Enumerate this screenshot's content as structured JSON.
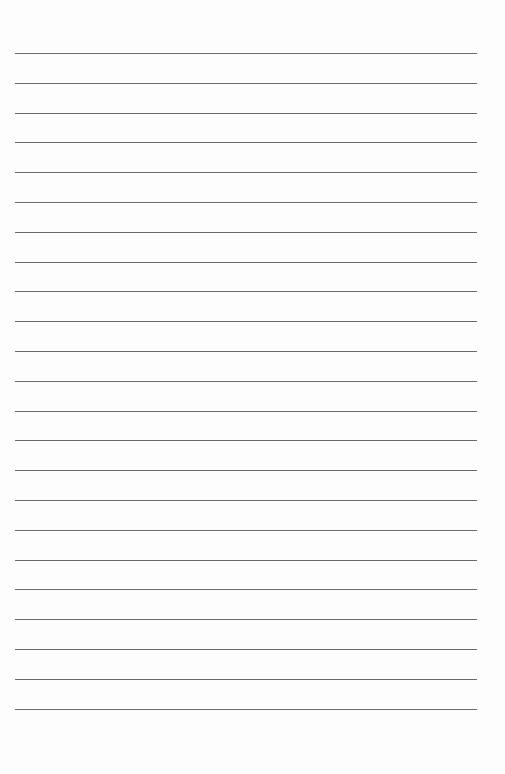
{
  "page": {
    "type": "lined-paper",
    "line_count": 23,
    "first_line_y": 53,
    "line_spacing": 29.8,
    "line_left": 15,
    "line_width": 462,
    "line_color": "#6a6a6a",
    "background": "#fdfdfd",
    "text_lines": []
  }
}
